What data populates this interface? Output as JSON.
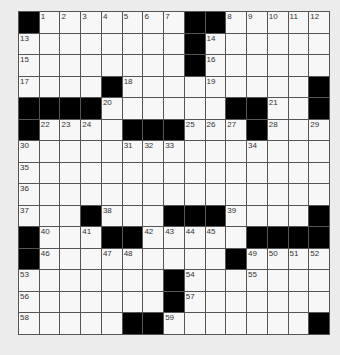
{
  "puzzle": {
    "rows": 15,
    "cols": 15,
    "layout": [
      "#1234567##89ABC",
      "D.......#E.....",
      "F.......#G.....",
      "H...#I...J....#",
      "####K.....##L.#",
      "#MNO.###PQR#S.T",
      "U....VWX...Y...",
      "Z..............",
      "a..............",
      "b..#c..###d...#",
      "#e.f##ghij.####",
      "#k..lm....#nopq",
      "r......#s..t...",
      "u......#v......",
      "w....##x......#"
    ],
    "numbers": {
      "1": 1,
      "2": 2,
      "3": 3,
      "4": 4,
      "5": 5,
      "6": 6,
      "7": 7,
      "8": 8,
      "9": 9,
      "A": 10,
      "B": 11,
      "C": 12,
      "D": 13,
      "E": 14,
      "F": 15,
      "G": 16,
      "H": 17,
      "I": 18,
      "J": 19,
      "K": 20,
      "L": 21,
      "M": 22,
      "N": 23,
      "O": 24,
      "P": 25,
      "Q": 26,
      "R": 27,
      "S": 28,
      "T": 29,
      "U": 30,
      "V": 31,
      "W": 32,
      "X": 33,
      "Y": 34,
      "Z": 35,
      "a": 36,
      "b": 37,
      "c": 38,
      "d": 39,
      "e": 40,
      "f": 41,
      "g": 42,
      "h": 43,
      "i": 44,
      "j": 45,
      "k": 46,
      "l": 47,
      "m": 48,
      "n": 49,
      "o": 50,
      "p": 51,
      "q": 52,
      "r": 53,
      "s": 54,
      "t": 55,
      "u": 56,
      "v": 57,
      "w": 58,
      "x": 59
    },
    "colors": {
      "background": "#ececec",
      "cell": "#f7f7f7",
      "block": "#000000",
      "line": "#555555"
    }
  }
}
